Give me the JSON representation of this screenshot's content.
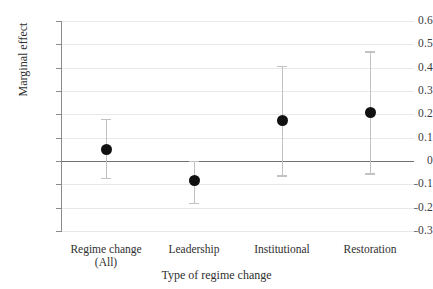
{
  "chart_data": {
    "type": "scatter",
    "title": "",
    "xlabel": "Type of regime change",
    "ylabel": "Marginal effect",
    "ylim": [
      -0.3,
      0.6
    ],
    "yticks": [
      0.6,
      0.5,
      0.4,
      0.3,
      0.2,
      0.1,
      0,
      -0.1,
      -0.2,
      -0.3
    ],
    "ytick_labels": [
      "0.6",
      "0.5",
      "0.4",
      "0.3",
      "0.2",
      "0.1",
      "0",
      "–0.1",
      "–0.2",
      "–0.3"
    ],
    "grid": true,
    "legend": "none",
    "zero_reference_line": 0,
    "categories": [
      "Regime change\n(All)",
      "Leadership",
      "Institutional",
      "Restoration"
    ],
    "category_labels": [
      "Regime change (All)",
      "Leadership",
      "Institutional",
      "Restoration"
    ],
    "values": [
      0.05,
      -0.085,
      0.173,
      0.21
    ],
    "ci_lower": [
      -0.073,
      -0.178,
      -0.062,
      -0.052
    ],
    "ci_upper": [
      0.18,
      0.0,
      0.408,
      0.47
    ],
    "marker": "filled-circle",
    "marker_color": "#111111",
    "errorbar_color": "#c2c2c2",
    "gridline_color": "#e8e8e8",
    "zero_line_color": "#707070",
    "axis_color": "#8a8a8a",
    "background_color": "#ffffff"
  }
}
